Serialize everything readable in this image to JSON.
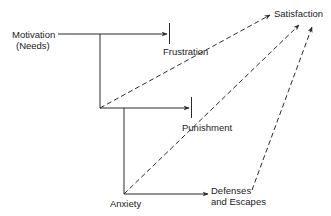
{
  "diagram": {
    "nodes": {
      "motivation": {
        "line1": "Motivation",
        "line2": "(Needs)"
      },
      "frustration": {
        "label": "Frustration"
      },
      "punishment": {
        "label": "Punishment"
      },
      "anxiety": {
        "label": "Anxiety"
      },
      "defenses": {
        "line1": "Defenses",
        "line2": "and Escapes"
      },
      "satisfaction": {
        "label": "Satisfaction"
      }
    },
    "edges": [
      {
        "from": "motivation",
        "to": "frustration",
        "style": "solid",
        "end": "blocked"
      },
      {
        "from": "motivation",
        "to": "punishment",
        "style": "solid",
        "end": "blocked"
      },
      {
        "from": "punishment-branch",
        "to": "anxiety",
        "style": "solid"
      },
      {
        "from": "anxiety",
        "to": "defenses",
        "style": "solid",
        "end": "arrow"
      },
      {
        "from": "motivation-branch",
        "to": "satisfaction",
        "style": "dashed",
        "end": "arrow"
      },
      {
        "from": "punishment-branch",
        "to": "satisfaction",
        "style": "dashed",
        "end": "arrow"
      },
      {
        "from": "anxiety",
        "to": "satisfaction",
        "style": "dashed",
        "end": "arrow"
      },
      {
        "from": "defenses",
        "to": "satisfaction",
        "style": "dashed",
        "end": "arrow"
      }
    ],
    "colors": {
      "line": "#2a2a2a",
      "background": "#ffffff"
    }
  }
}
